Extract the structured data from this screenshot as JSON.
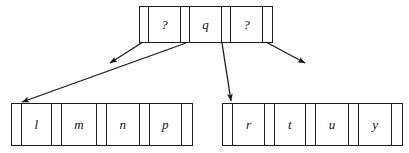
{
  "diagram": {
    "stroke_color": "#1a1a1a",
    "background_color": "#ffffff",
    "nodes": [
      {
        "id": "root",
        "role": "internal-node",
        "cells": [
          {
            "type": "pointer",
            "label": ""
          },
          {
            "type": "key",
            "label": "?"
          },
          {
            "type": "pointer",
            "label": ""
          },
          {
            "type": "key",
            "label": "q"
          },
          {
            "type": "pointer",
            "label": ""
          },
          {
            "type": "key",
            "label": "?"
          },
          {
            "type": "pointer",
            "label": ""
          }
        ]
      },
      {
        "id": "leaf-left",
        "role": "leaf-node",
        "cells": [
          {
            "type": "pointer",
            "label": ""
          },
          {
            "type": "key",
            "label": "l"
          },
          {
            "type": "pointer",
            "label": ""
          },
          {
            "type": "key",
            "label": "m"
          },
          {
            "type": "pointer",
            "label": ""
          },
          {
            "type": "key",
            "label": "n"
          },
          {
            "type": "pointer",
            "label": ""
          },
          {
            "type": "key",
            "label": "p"
          },
          {
            "type": "pointer",
            "label": ""
          }
        ]
      },
      {
        "id": "leaf-right",
        "role": "leaf-node",
        "cells": [
          {
            "type": "pointer",
            "label": ""
          },
          {
            "type": "key",
            "label": "r"
          },
          {
            "type": "pointer",
            "label": ""
          },
          {
            "type": "key",
            "label": "t"
          },
          {
            "type": "pointer",
            "label": ""
          },
          {
            "type": "key",
            "label": "u"
          },
          {
            "type": "pointer",
            "label": ""
          },
          {
            "type": "key",
            "label": "y"
          },
          {
            "type": "pointer",
            "label": ""
          }
        ]
      }
    ],
    "arrows": [
      {
        "id": "arrow-root-stub-left",
        "from": [
          143,
          42
        ],
        "to": [
          110,
          63
        ]
      },
      {
        "id": "arrow-root-to-leaf-left",
        "from": [
          186,
          43
        ],
        "to": [
          22,
          102
        ]
      },
      {
        "id": "arrow-root-to-leaf-right",
        "from": [
          222,
          43
        ],
        "to": [
          231,
          101
        ]
      },
      {
        "id": "arrow-root-stub-right",
        "from": [
          266,
          42
        ],
        "to": [
          305,
          63
        ]
      }
    ]
  }
}
